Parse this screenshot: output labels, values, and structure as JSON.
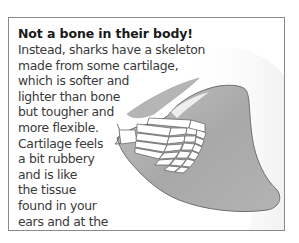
{
  "panel": {
    "heading": "Not a bone in their body!",
    "lines": [
      "Instead, sharks have a skeleton",
      "made from some cartilage,",
      "which is softer and",
      "lighter than bone",
      "but tougher and",
      "more flexible.",
      "Cartilage feels",
      "a bit rubbery",
      "and is like",
      "the tissue",
      "found in your",
      "ears and at the",
      "tip of your nose!"
    ],
    "illustration": {
      "subject": "shark-fin-cartilage-skeleton",
      "fin_color": "#a9a9a9",
      "fin_edge_color": "#6e6e6e",
      "skeleton_color": "#ffffff",
      "border_color": "#8a8a8a"
    }
  }
}
